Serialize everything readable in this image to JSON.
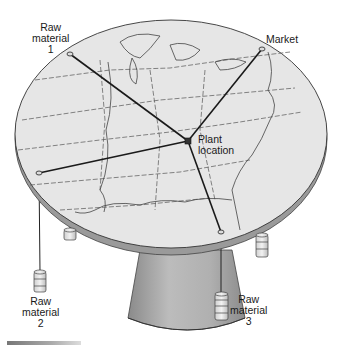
{
  "diagram": {
    "type": "varignon-frame-location-model",
    "labels": {
      "raw_material_1": [
        "Raw",
        "material",
        "1"
      ],
      "raw_material_2": [
        "Raw",
        "material",
        "2"
      ],
      "raw_material_3": [
        "Raw",
        "material",
        "3"
      ],
      "market": [
        "Market"
      ],
      "plant": [
        "Plant",
        "location"
      ]
    },
    "nodes": [
      {
        "id": "raw_material_1",
        "x": 70,
        "y": 54
      },
      {
        "id": "market",
        "x": 262,
        "y": 49
      },
      {
        "id": "raw_material_2",
        "x": 39,
        "y": 173
      },
      {
        "id": "raw_material_3",
        "x": 221,
        "y": 232
      },
      {
        "id": "plant",
        "x": 188,
        "y": 141
      }
    ],
    "edges": [
      {
        "from": "raw_material_1",
        "to": "plant"
      },
      {
        "from": "market",
        "to": "plant"
      },
      {
        "from": "raw_material_2",
        "to": "plant"
      },
      {
        "from": "raw_material_3",
        "to": "plant"
      }
    ],
    "map_region": "Eastern United States",
    "colors": {
      "table_top": "#e6e6e6",
      "table_rim": "#9a9a9a",
      "pedestal": "#a8a8a8",
      "string": "#1a1a1a",
      "border_lines": "#555555"
    }
  }
}
